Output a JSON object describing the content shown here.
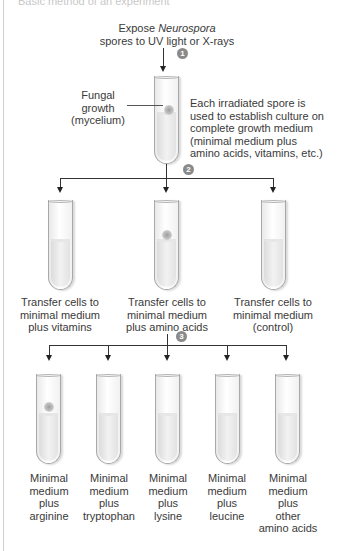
{
  "header_clip": "Basic method of an experiment",
  "step1": {
    "badge": "1",
    "label_line1_prefix": "Expose ",
    "label_line1_italic": "Neurospora",
    "label_line2": "spores to UV light or X-rays"
  },
  "parent_tube": {
    "pointer_label": [
      "Fungal",
      "growth",
      "(mycelium)"
    ],
    "description": [
      "Each irradiated spore is",
      "used to establish culture on",
      "complete growth medium",
      "(minimal medium plus",
      "amino acids, vitamins, etc.)"
    ]
  },
  "step2": {
    "badge": "2",
    "tubes": [
      {
        "growth": false,
        "label": [
          "Transfer cells to",
          "minimal medium",
          "plus vitamins"
        ]
      },
      {
        "growth": true,
        "label": [
          "Transfer cells to",
          "minimal medium",
          "plus amino acids"
        ]
      },
      {
        "growth": false,
        "label": [
          "Transfer cells to",
          "minimal medium",
          "(control)"
        ]
      }
    ]
  },
  "step3": {
    "badge": "3",
    "tubes": [
      {
        "growth": true,
        "label": [
          "Minimal",
          "medium",
          "plus",
          "arginine"
        ]
      },
      {
        "growth": false,
        "label": [
          "Minimal",
          "medium",
          "plus",
          "tryptophan"
        ]
      },
      {
        "growth": false,
        "label": [
          "Minimal",
          "medium",
          "plus",
          "lysine"
        ]
      },
      {
        "growth": false,
        "label": [
          "Minimal",
          "medium",
          "plus",
          "leucine"
        ]
      },
      {
        "growth": false,
        "label": [
          "Minimal",
          "medium",
          "plus",
          "other",
          "amino acids"
        ]
      }
    ]
  },
  "colors": {
    "line": "#333333",
    "badge": "#8a8a8a",
    "text": "#3a3a3a",
    "tube_border": "#a8a8a8"
  }
}
